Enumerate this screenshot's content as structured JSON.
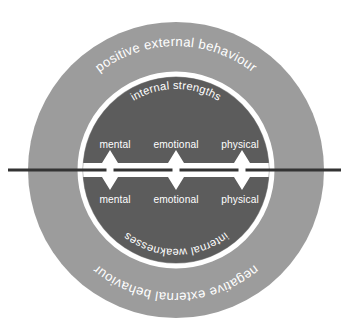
{
  "diagram": {
    "colors": {
      "background": "#ffffff",
      "outer_ring": "#9c9c9c",
      "inner_circle": "#5c5c5c",
      "ring_divider": "#ffffff",
      "label_text": "#ffffff",
      "axis_line": "#333333",
      "axis_line_halo": "#ffffff",
      "arrow_fill": "#ffffff"
    },
    "geometry": {
      "center_x": 176,
      "center_y": 170,
      "outer_radius": 148,
      "inner_radius": 93,
      "axis_y": 170,
      "axis_start_x": 8,
      "axis_end_x": 341
    },
    "arcs": {
      "top_outer": "positive external behaviour",
      "top_inner": "internal strengths",
      "bottom_inner": "internal weaknesses",
      "bottom_outer": "negative external behaviour"
    },
    "upper_cells": [
      {
        "label": "mental",
        "x": 115
      },
      {
        "label": "emotional",
        "x": 176
      },
      {
        "label": "physical",
        "x": 240
      }
    ],
    "lower_cells": [
      {
        "label": "mental",
        "x": 115
      },
      {
        "label": "emotional",
        "x": 176
      },
      {
        "label": "physical",
        "x": 240
      }
    ],
    "arrows": [
      {
        "name": "mental-arrow",
        "x": 110
      },
      {
        "name": "emotional-arrow",
        "x": 176
      },
      {
        "name": "physical-arrow",
        "x": 242
      }
    ]
  }
}
